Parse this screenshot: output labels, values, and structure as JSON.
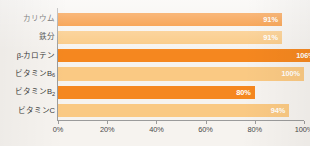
{
  "chart_data": {
    "type": "bar",
    "orientation": "horizontal",
    "title": "",
    "subtitle": "",
    "xlabel": "",
    "ylabel": "",
    "categories": [
      "カリウム",
      "鉄分",
      "β-カロテン",
      "ビタミンB6",
      "ビタミンB2",
      "ビタミンC"
    ],
    "category_labels_html": [
      "カリウム",
      "鉄分",
      "β-カロテン",
      "ビタミンB<sub>6</sub>",
      "ビタミンB<sub>2</sub>",
      "ビタミンC"
    ],
    "values": [
      91,
      91,
      106,
      100,
      80,
      94
    ],
    "value_labels": [
      "91%",
      "91%",
      "106%",
      "100%",
      "80%",
      "94%"
    ],
    "bar_colors": [
      "#f5871f",
      "#fac983",
      "#f5871f",
      "#fac983",
      "#f5871f",
      "#fac983"
    ],
    "xlim": [
      0,
      100
    ],
    "xticks": [
      0,
      20,
      40,
      60,
      80,
      100
    ],
    "xtick_labels": [
      "0%",
      "20%",
      "40%",
      "60%",
      "80%",
      "100%"
    ],
    "grid": false,
    "legend": null,
    "value_label_position": "inside-end",
    "value_label_color": "#ffffff"
  },
  "style": {
    "background": "#f6f3ef",
    "axis_color": "#9b9b9b",
    "accent_dark": "#f5871f",
    "accent_light": "#fac983",
    "label_color": "#3b3b3b",
    "tick_color": "#4a4a4a"
  }
}
